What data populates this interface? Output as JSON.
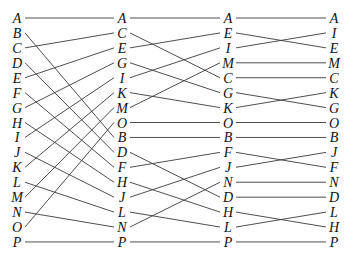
{
  "diagram": {
    "type": "permutation-network",
    "columns": [
      {
        "name": "stage-0",
        "labels": [
          "A",
          "B",
          "C",
          "D",
          "E",
          "F",
          "G",
          "H",
          "I",
          "J",
          "K",
          "L",
          "M",
          "N",
          "O",
          "P"
        ]
      },
      {
        "name": "stage-1",
        "labels": [
          "A",
          "C",
          "E",
          "G",
          "I",
          "K",
          "M",
          "O",
          "B",
          "D",
          "F",
          "H",
          "J",
          "L",
          "N",
          "P"
        ]
      },
      {
        "name": "stage-2",
        "labels": [
          "A",
          "E",
          "I",
          "M",
          "C",
          "G",
          "K",
          "O",
          "B",
          "F",
          "J",
          "N",
          "D",
          "H",
          "L",
          "P"
        ]
      },
      {
        "name": "stage-3",
        "labels": [
          "A",
          "I",
          "E",
          "M",
          "C",
          "K",
          "G",
          "O",
          "B",
          "J",
          "F",
          "N",
          "D",
          "L",
          "H",
          "P"
        ]
      }
    ],
    "colors": {
      "line": "#3a3a3a",
      "text": "#111111",
      "background": "#ffffff"
    }
  }
}
